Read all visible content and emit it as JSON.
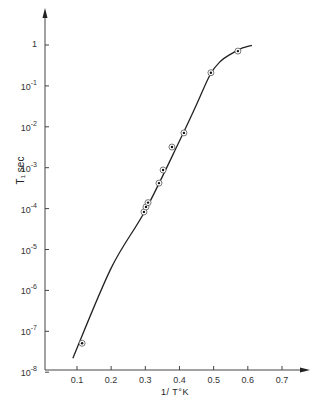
{
  "chart_data": {
    "type": "scatter",
    "title": "",
    "xlabel": "1/ T°K",
    "ylabel": "T₁ sec",
    "xlim": [
      0,
      0.75
    ],
    "ylim": [
      1e-08,
      10
    ],
    "yscale": "log",
    "grid": false,
    "legend": null,
    "x_ticks": [
      "0.1",
      "0.2",
      "0.3",
      "0.4",
      "0.5",
      "0.6",
      "0.7"
    ],
    "x_tick_values": [
      0.1,
      0.2,
      0.3,
      0.4,
      0.5,
      0.6,
      0.7
    ],
    "y_ticks": [
      {
        "base": "1",
        "exp": ""
      },
      {
        "base": "10",
        "exp": "-1"
      },
      {
        "base": "10",
        "exp": "-2"
      },
      {
        "base": "10",
        "exp": "-3"
      },
      {
        "base": "10",
        "exp": "-4"
      },
      {
        "base": "10",
        "exp": "-5"
      },
      {
        "base": "10",
        "exp": "-6"
      },
      {
        "base": "10",
        "exp": "-7"
      },
      {
        "base": "10",
        "exp": "-8"
      }
    ],
    "y_tick_log_values": [
      0,
      -1,
      -2,
      -3,
      -4,
      -5,
      -6,
      -7,
      -8
    ],
    "series": [
      {
        "name": "measured",
        "marker": "circled-dot",
        "x": [
          0.115,
          0.296,
          0.302,
          0.308,
          0.34,
          0.352,
          0.378,
          0.413,
          0.492,
          0.571
        ],
        "y": [
          5.1e-08,
          8.3e-05,
          0.00011,
          0.00014,
          0.00042,
          0.00088,
          0.0032,
          0.0071,
          0.21,
          0.71
        ]
      },
      {
        "name": "fit-curve",
        "marker": "line",
        "x": [
          0.088,
          0.2,
          0.3,
          0.4,
          0.45,
          0.49,
          0.52,
          0.55,
          0.58,
          0.612
        ],
        "y": [
          2.2e-08,
          3.5e-06,
          9e-05,
          0.0045,
          0.035,
          0.19,
          0.4,
          0.6,
          0.82,
          0.98
        ]
      }
    ]
  }
}
